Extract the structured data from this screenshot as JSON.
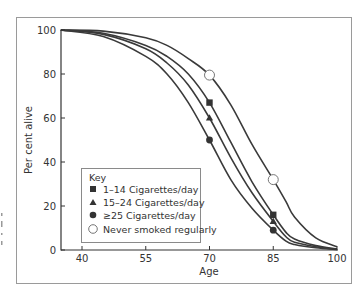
{
  "chart_data": {
    "type": "line",
    "title": "",
    "xlabel": "Age",
    "ylabel": "Per cent alive",
    "xlim": [
      35,
      100
    ],
    "ylim": [
      0,
      100
    ],
    "x_ticks": [
      40,
      55,
      70,
      85,
      100
    ],
    "y_ticks": [
      0,
      20,
      40,
      60,
      80,
      100
    ],
    "grid": false,
    "legend_position": "lower left (inside plot)",
    "legend_title": "Key",
    "x": [
      35,
      45,
      55,
      60,
      65,
      70,
      75,
      80,
      85,
      88,
      90,
      95,
      100
    ],
    "series": [
      {
        "name": "1–14 Cigarettes/day",
        "marker": "square",
        "values": [
          100,
          98.5,
          93,
          88,
          80,
          67,
          49,
          31,
          16,
          8,
          5,
          2,
          0.5
        ],
        "marked_points": [
          [
            70,
            67
          ],
          [
            85,
            16
          ]
        ]
      },
      {
        "name": "15–24 Cigarettes/day",
        "marker": "triangle",
        "values": [
          100,
          98,
          91.5,
          85,
          75,
          60,
          42,
          26,
          13,
          6,
          3.5,
          1.5,
          0.3
        ],
        "marked_points": [
          [
            70,
            60
          ],
          [
            85,
            13
          ]
        ]
      },
      {
        "name": "≥25 Cigarettes/day",
        "marker": "filled-circle",
        "values": [
          100,
          97,
          88,
          80,
          67,
          50,
          32,
          19,
          9,
          4,
          2.5,
          1,
          0.2
        ],
        "marked_points": [
          [
            70,
            50
          ],
          [
            85,
            9
          ]
        ]
      },
      {
        "name": "Never smoked regularly",
        "marker": "open-circle",
        "values": [
          100,
          99.5,
          96.5,
          93,
          87,
          79.5,
          66,
          48,
          32,
          22,
          15,
          5.5,
          1.5
        ],
        "marked_points": [
          [
            70,
            79.5
          ],
          [
            85,
            32
          ]
        ]
      }
    ]
  },
  "axes": {
    "xlabel": "Age",
    "ylabel": "Per cent alive",
    "x_ticks": [
      "40",
      "55",
      "70",
      "85",
      "100"
    ],
    "y_ticks": [
      "0",
      "20",
      "40",
      "60",
      "80",
      "100"
    ]
  },
  "legend": {
    "title": "Key",
    "items": [
      {
        "label": "1–14 Cigarettes/day",
        "marker": "square"
      },
      {
        "label": "15–24 Cigarettes/day",
        "marker": "triangle"
      },
      {
        "label": "≥25 Cigarettes/day",
        "marker": "filled-circle"
      },
      {
        "label": "Never smoked regularly",
        "marker": "open-circle"
      }
    ]
  },
  "colors": {
    "line": "#3a3a3a",
    "frame": "#9a9a9a",
    "background": "#ffffff"
  }
}
